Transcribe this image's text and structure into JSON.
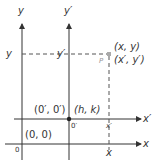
{
  "diagram": {
    "type": "coordinate-translation",
    "colors": {
      "axis": "#333333",
      "dashed": "#555555",
      "point": "#999999",
      "origin_prime": "#222222"
    },
    "axes": {
      "y_label": "y",
      "y_prime_label": "y′",
      "x_label": "x",
      "x_prime_label": "x′",
      "origin_label": "0",
      "origin_prime_label": "0′"
    },
    "labels": {
      "y_tick": "y",
      "y_prime_tick": "y′",
      "x_tick": "x",
      "x_prime_tick": "x′",
      "point_name": "P",
      "point_xy": "(x, y)",
      "point_prime": "(x′, y′)",
      "origin_prime_coords": "(0′, 0′)",
      "hk": "(h, k)",
      "origin_coords": "(0, 0)"
    }
  }
}
